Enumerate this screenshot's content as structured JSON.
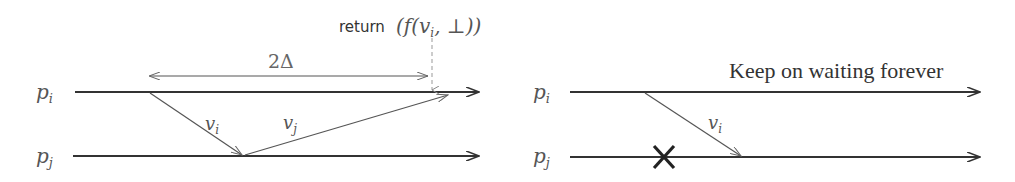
{
  "left_diagram": {
    "process_i_label": "p",
    "process_i_sub": "i",
    "process_j_label": "p",
    "process_j_sub": "j",
    "interval_label": "2Δ",
    "return_keyword": "return",
    "return_expr_open": "(f(v",
    "return_expr_sub": "i",
    "return_expr_close": ", ⊥))",
    "message_1": {
      "label": "v",
      "sub": "i",
      "from": "p_i",
      "to": "p_j"
    },
    "message_2": {
      "label": "v",
      "sub": "j",
      "from": "p_j",
      "to": "p_i"
    }
  },
  "right_diagram": {
    "process_i_label": "p",
    "process_i_sub": "i",
    "process_j_label": "p",
    "process_j_sub": "j",
    "caption": "Keep on waiting forever",
    "message_1": {
      "label": "v",
      "sub": "i",
      "from": "p_i",
      "to": "p_j"
    },
    "crash_marker": "×"
  },
  "colors": {
    "timeline": "#333333",
    "message": "#555555",
    "label": "#555555",
    "dashed": "#999999",
    "crash": "#222222"
  }
}
